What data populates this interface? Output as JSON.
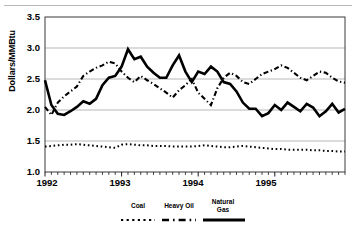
{
  "chart_data": {
    "type": "line",
    "title": "",
    "xlabel": "",
    "ylabel": "Dollars/MMBtu",
    "ylim": [
      1.0,
      3.5
    ],
    "yticks": [
      "1.0",
      "1.5",
      "2.0",
      "2.5",
      "3.0",
      "3.5"
    ],
    "ytick_values": [
      1.0,
      1.5,
      2.0,
      2.5,
      3.0,
      3.5
    ],
    "xticks": [
      "1992",
      "1993",
      "1994",
      "1995"
    ],
    "xtick_values": [
      0,
      12,
      24,
      36
    ],
    "xlim": [
      0,
      47
    ],
    "grid": "horizontal",
    "legend_position": "bottom",
    "x_minor_ticks": "monthly",
    "series": [
      {
        "name": "Coal",
        "style": "dotted",
        "color": "#000000",
        "values": [
          1.41,
          1.42,
          1.43,
          1.44,
          1.44,
          1.45,
          1.44,
          1.43,
          1.42,
          1.41,
          1.4,
          1.39,
          1.44,
          1.45,
          1.44,
          1.43,
          1.43,
          1.42,
          1.42,
          1.42,
          1.41,
          1.41,
          1.41,
          1.41,
          1.42,
          1.43,
          1.42,
          1.41,
          1.4,
          1.4,
          1.41,
          1.42,
          1.41,
          1.4,
          1.39,
          1.38,
          1.37,
          1.37,
          1.36,
          1.36,
          1.36,
          1.36,
          1.35,
          1.35,
          1.34,
          1.34,
          1.33,
          1.33
        ]
      },
      {
        "name": "Heavy Oil",
        "style": "dash-dot",
        "color": "#000000",
        "values": [
          2.05,
          1.92,
          2.12,
          2.22,
          2.3,
          2.38,
          2.55,
          2.62,
          2.68,
          2.72,
          2.78,
          2.75,
          2.62,
          2.52,
          2.45,
          2.55,
          2.48,
          2.42,
          2.35,
          2.28,
          2.2,
          2.32,
          2.4,
          2.5,
          2.28,
          2.18,
          2.08,
          2.35,
          2.52,
          2.6,
          2.55,
          2.45,
          2.42,
          2.5,
          2.58,
          2.62,
          2.66,
          2.72,
          2.68,
          2.6,
          2.52,
          2.48,
          2.55,
          2.62,
          2.6,
          2.52,
          2.46,
          2.44
        ]
      },
      {
        "name": "Natural Gas",
        "style": "solid",
        "color": "#000000",
        "values": [
          2.48,
          2.08,
          1.94,
          1.92,
          1.98,
          2.05,
          2.14,
          2.1,
          2.18,
          2.4,
          2.52,
          2.55,
          2.7,
          2.98,
          2.82,
          2.86,
          2.7,
          2.6,
          2.52,
          2.52,
          2.72,
          2.88,
          2.62,
          2.45,
          2.62,
          2.58,
          2.7,
          2.62,
          2.45,
          2.42,
          2.3,
          2.12,
          2.02,
          2.02,
          1.9,
          1.95,
          2.08,
          2.0,
          2.12,
          2.05,
          1.98,
          2.1,
          2.04,
          1.9,
          1.98,
          2.1,
          1.96,
          2.02
        ]
      }
    ]
  },
  "legend": {
    "items": [
      {
        "label": "Coal"
      },
      {
        "label": "Heavy Oil"
      },
      {
        "label": "Natural\nGas"
      }
    ]
  }
}
